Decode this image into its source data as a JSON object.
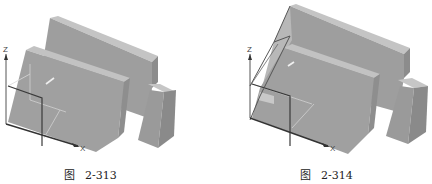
{
  "figures": [
    {
      "id": "left",
      "caption_prefix": "图",
      "caption_number": "2-313",
      "axis_labels": {
        "z": "Z",
        "x": "X",
        "y": "Y"
      },
      "description": "Isometric shaded model with UCS icon at bottom-left origin; sketch rectangle outline on front face"
    },
    {
      "id": "right",
      "caption_prefix": "图",
      "caption_number": "2-314",
      "axis_labels": {
        "z": "Z",
        "x": "X",
        "y": "Y"
      },
      "description": "Same model with additional extruded wedge outline at left, UCS icon at origin"
    }
  ],
  "colors": {
    "face_front": "#9c9c9c",
    "face_top": "#c4c4c4",
    "face_side": "#8a8a8a",
    "edge": "#6e6e6e",
    "sketch_line": "#3a3a3a",
    "guide_line": "#d8d8d8",
    "background": "#ffffff"
  }
}
